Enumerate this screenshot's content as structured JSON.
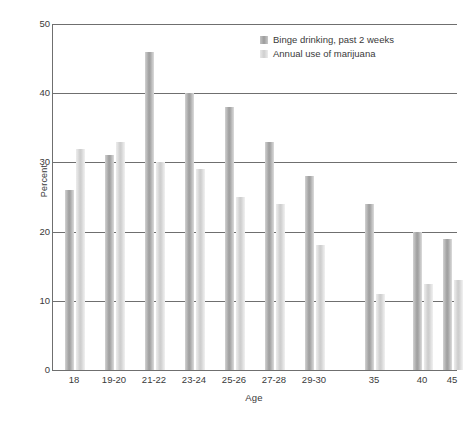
{
  "chart_data": {
    "type": "bar",
    "title": "",
    "xlabel": "Age",
    "ylabel": "Percent",
    "categories": [
      "18",
      "19-20",
      "21-22",
      "23-24",
      "25-26",
      "27-28",
      "29-30",
      "35",
      "40",
      "45"
    ],
    "series": [
      {
        "name": "Binge drinking, past 2 weeks",
        "color": "#9e9e9e",
        "values": [
          26,
          31,
          46,
          40,
          38,
          33,
          28,
          24,
          20,
          19
        ]
      },
      {
        "name": "Annual use of marijuana",
        "color": "#cccccc",
        "values": [
          32,
          33,
          30,
          29,
          25,
          24,
          18,
          11,
          12.5,
          13
        ]
      }
    ],
    "ylim": [
      0,
      50
    ],
    "yticks": [
      0,
      10,
      20,
      30,
      40,
      50
    ],
    "ytick_labels": [
      "0",
      "10",
      "20",
      "30",
      "40",
      "50"
    ],
    "grid": true,
    "legend_position": "top-right"
  },
  "axes": {
    "y_title": "Percent",
    "x_title": "Age"
  },
  "legend": {
    "entries": [
      {
        "label": "Binge drinking, past 2 weeks"
      },
      {
        "label": "Annual use of marijuana"
      }
    ]
  }
}
